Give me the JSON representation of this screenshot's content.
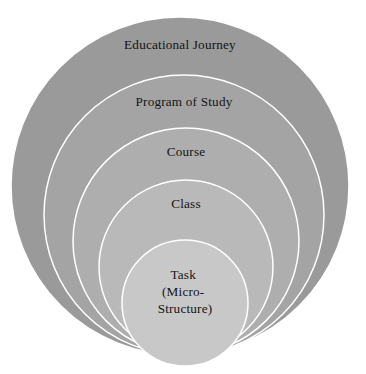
{
  "diagram": {
    "type": "nested-concentric-circles",
    "orientation": "bottom-aligned nested circles, largest outermost",
    "background_color": "#ffffff",
    "stroke_color": "#ffffff",
    "text_color": "#141414",
    "levels": [
      {
        "id": "level-1",
        "label": "Educational Journey",
        "fill": "#9a9a9a",
        "depth": 1,
        "cx": 180,
        "cy": 186,
        "r": 169,
        "label_x": 180,
        "label_y": 46
      },
      {
        "id": "level-2",
        "label": "Program of Study",
        "fill": "#a4a4a4",
        "depth": 2,
        "cx": 184,
        "cy": 215,
        "r": 140,
        "label_x": 184,
        "label_y": 103
      },
      {
        "id": "level-3",
        "label": "Course",
        "fill": "#aeaeae",
        "depth": 3,
        "cx": 186,
        "cy": 241,
        "r": 113,
        "label_x": 186,
        "label_y": 153
      },
      {
        "id": "level-4",
        "label": "Class",
        "fill": "#b9b9b9",
        "depth": 4,
        "cx": 186,
        "cy": 267,
        "r": 87,
        "label_x": 186,
        "label_y": 205
      },
      {
        "id": "level-5",
        "label": "Task",
        "label_lines": [
          "Task",
          "(Micro-",
          "Structure)"
        ],
        "fill": "#c8c8c8",
        "depth": 5,
        "cx": 185,
        "cy": 303,
        "r": 63,
        "label_x": 185,
        "label_y": 276
      }
    ]
  }
}
